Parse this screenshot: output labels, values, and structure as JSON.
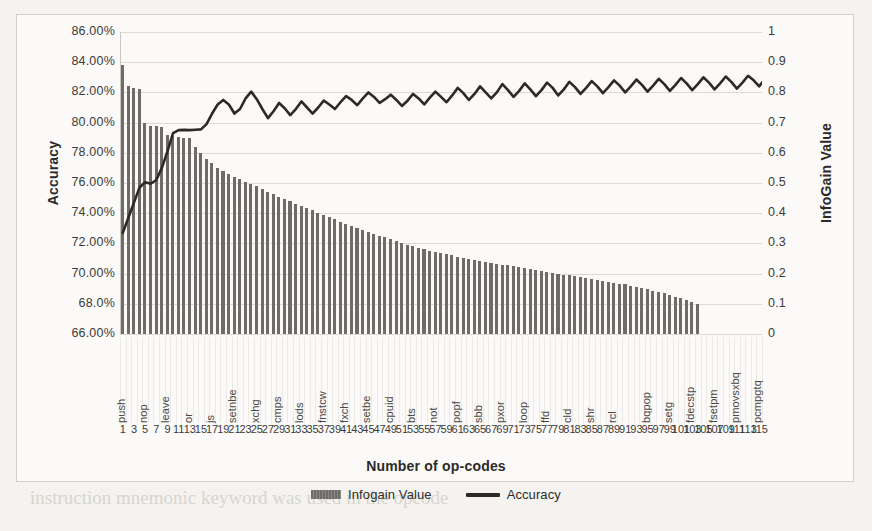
{
  "chart_data": {
    "type": "bar",
    "title": "",
    "xlabel": "Number of op-codes",
    "ylabel": "Accuracy",
    "y2label": "InfoGain Value",
    "ylim": [
      0.66,
      0.86
    ],
    "y2lim": [
      0,
      1
    ],
    "grid": true,
    "legend_position": "bottom",
    "y_ticklabels": [
      "86.00%",
      "84.00%",
      "82.00%",
      "80.00%",
      "78.00%",
      "76.00%",
      "74.00%",
      "72.00%",
      "70.00%",
      "68.0%",
      "66.00%"
    ],
    "y_tickvalues": [
      0.86,
      0.84,
      0.82,
      0.8,
      0.78,
      0.76,
      0.74,
      0.72,
      0.7,
      0.68,
      0.66
    ],
    "y2_ticklabels": [
      "1",
      "0.9",
      "0.8",
      "0.7",
      "0.6",
      "0.5",
      "0.4",
      "0.3",
      "0.2",
      "0.1",
      "0"
    ],
    "y2_tickvalues": [
      1,
      0.9,
      0.8,
      0.7,
      0.6,
      0.5,
      0.4,
      0.3,
      0.2,
      0.1,
      0
    ],
    "x_ticklabels": [
      "1",
      "3",
      "5",
      "7",
      "9",
      "11",
      "13",
      "15",
      "17",
      "19",
      "21",
      "23",
      "25",
      "27",
      "29",
      "31",
      "33",
      "35",
      "37",
      "39",
      "41",
      "43",
      "45",
      "47",
      "49",
      "51",
      "53",
      "55",
      "57",
      "59",
      "61",
      "63",
      "65",
      "67",
      "69",
      "71",
      "73",
      "75",
      "77",
      "79",
      "81",
      "83",
      "85",
      "87",
      "89",
      "91",
      "93",
      "95",
      "97",
      "99",
      "101",
      "103",
      "105",
      "107",
      "109",
      "111",
      "113",
      "115"
    ],
    "opcode_labels": [
      "push",
      "nop",
      "leave",
      "or",
      "js",
      "setnbe",
      "xchg",
      "cmps",
      "lods",
      "fnstcw",
      "fxch",
      "setbe",
      "cpuid",
      "bts",
      "not",
      "popf",
      "sbb",
      "pxor",
      "loop",
      "ffd",
      "cld",
      "shr",
      "rcl",
      "bqpop",
      "setg",
      "fdecstp",
      "fsetpm",
      "pmovsxbq",
      "pcmpgtq"
    ],
    "opcode_label_positions": [
      1,
      5,
      9,
      13,
      17,
      21,
      25,
      29,
      33,
      37,
      41,
      45,
      49,
      53,
      57,
      61,
      65,
      69,
      73,
      77,
      81,
      85,
      89,
      95,
      99,
      103,
      107,
      111,
      115
    ],
    "series": [
      {
        "name": "Infogain Value",
        "axis": "right",
        "kind": "bar",
        "color": "#6e6c69",
        "values": [
          0.89,
          0.82,
          0.815,
          0.81,
          0.7,
          0.69,
          0.688,
          0.686,
          0.66,
          0.655,
          0.652,
          0.65,
          0.648,
          0.62,
          0.6,
          0.58,
          0.565,
          0.55,
          0.54,
          0.53,
          0.52,
          0.512,
          0.505,
          0.498,
          0.49,
          0.48,
          0.47,
          0.462,
          0.455,
          0.448,
          0.44,
          0.432,
          0.425,
          0.418,
          0.41,
          0.402,
          0.395,
          0.388,
          0.38,
          0.372,
          0.365,
          0.358,
          0.35,
          0.344,
          0.338,
          0.332,
          0.326,
          0.32,
          0.314,
          0.308,
          0.302,
          0.296,
          0.29,
          0.285,
          0.28,
          0.276,
          0.272,
          0.268,
          0.264,
          0.26,
          0.256,
          0.252,
          0.248,
          0.245,
          0.242,
          0.239,
          0.236,
          0.233,
          0.23,
          0.227,
          0.224,
          0.221,
          0.218,
          0.215,
          0.212,
          0.209,
          0.206,
          0.203,
          0.2,
          0.197,
          0.194,
          0.191,
          0.188,
          0.185,
          0.182,
          0.179,
          0.176,
          0.173,
          0.17,
          0.167,
          0.164,
          0.16,
          0.156,
          0.152,
          0.148,
          0.144,
          0.14,
          0.135,
          0.13,
          0.124,
          0.118,
          0.112,
          0.106,
          0.1
        ]
      },
      {
        "name": "Accuracy",
        "axis": "left",
        "kind": "line",
        "color": "#2b2a28",
        "values": [
          0.727,
          0.737,
          0.747,
          0.757,
          0.7605,
          0.7595,
          0.762,
          0.77,
          0.781,
          0.793,
          0.795,
          0.7952,
          0.795,
          0.7953,
          0.7955,
          0.799,
          0.806,
          0.812,
          0.815,
          0.812,
          0.806,
          0.809,
          0.816,
          0.8205,
          0.8155,
          0.809,
          0.803,
          0.8075,
          0.813,
          0.8095,
          0.805,
          0.809,
          0.814,
          0.81,
          0.806,
          0.81,
          0.8145,
          0.812,
          0.809,
          0.8135,
          0.8175,
          0.815,
          0.8115,
          0.816,
          0.82,
          0.817,
          0.813,
          0.8155,
          0.8185,
          0.815,
          0.811,
          0.8145,
          0.819,
          0.816,
          0.812,
          0.8165,
          0.8205,
          0.817,
          0.8135,
          0.818,
          0.823,
          0.8195,
          0.815,
          0.819,
          0.824,
          0.82,
          0.816,
          0.82,
          0.8255,
          0.8215,
          0.817,
          0.821,
          0.826,
          0.822,
          0.8175,
          0.8215,
          0.8265,
          0.823,
          0.818,
          0.822,
          0.827,
          0.8235,
          0.819,
          0.823,
          0.8275,
          0.824,
          0.8195,
          0.8235,
          0.828,
          0.8245,
          0.82,
          0.824,
          0.8285,
          0.825,
          0.8205,
          0.8245,
          0.829,
          0.8255,
          0.821,
          0.825,
          0.8295,
          0.826,
          0.8215,
          0.8255,
          0.83,
          0.8265,
          0.822,
          0.826,
          0.8305,
          0.827,
          0.8225,
          0.8265,
          0.831,
          0.828,
          0.824,
          0.829,
          0.833
        ]
      }
    ]
  },
  "legend": {
    "items": [
      {
        "label": "Infogain Value",
        "marker": "bar-swatch"
      },
      {
        "label": "Accuracy",
        "marker": "line-swatch"
      }
    ]
  },
  "axis_titles": {
    "left": "Accuracy",
    "right": "InfoGain Value",
    "bottom": "Number of op-codes"
  },
  "background_bleed": [
    {
      "text": "mixed instructions and their respective weights. The",
      "x": 35,
      "y": 452,
      "size": 19
    },
    {
      "text": "instruction mnemonic keyword was used in the opcode",
      "x": 30,
      "y": 487,
      "size": 19
    }
  ]
}
